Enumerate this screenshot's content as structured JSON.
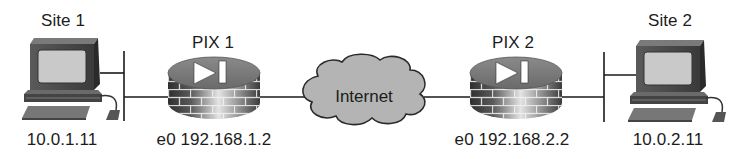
{
  "diagram": {
    "type": "network-topology",
    "nodes": [
      {
        "id": "site1",
        "kind": "workstation",
        "title": "Site 1",
        "address": "10.0.1.11"
      },
      {
        "id": "pix1",
        "kind": "pix-firewall",
        "title": "PIX 1",
        "address": "e0 192.168.1.2"
      },
      {
        "id": "internet",
        "kind": "cloud",
        "title": "Internet"
      },
      {
        "id": "pix2",
        "kind": "pix-firewall",
        "title": "PIX 2",
        "address": "e0 192.168.2.2"
      },
      {
        "id": "site2",
        "kind": "workstation",
        "title": "Site 2",
        "address": "10.0.2.11"
      }
    ],
    "links": [
      {
        "from": "site1",
        "to": "pix1",
        "via": "lan-segment-1"
      },
      {
        "from": "pix1",
        "to": "internet"
      },
      {
        "from": "internet",
        "to": "pix2"
      },
      {
        "from": "pix2",
        "to": "site2",
        "via": "lan-segment-2"
      }
    ]
  },
  "labels": {
    "site1_title": "Site 1",
    "site1_ip": "10.0.1.11",
    "pix1_title": "PIX 1",
    "pix1_ip": "e0 192.168.1.2",
    "internet": "Internet",
    "pix2_title": "PIX 2",
    "pix2_ip": "e0 192.168.2.2",
    "site2_title": "Site 2",
    "site2_ip": "10.0.2.11"
  },
  "colors": {
    "line": "#1a1a1a",
    "cloud_fill": "#b4b4b4",
    "device_dark": "#3a3a3a",
    "device_mid": "#7a7a7a",
    "device_light": "#d8d8d8",
    "screen": "#c8c8c8"
  }
}
